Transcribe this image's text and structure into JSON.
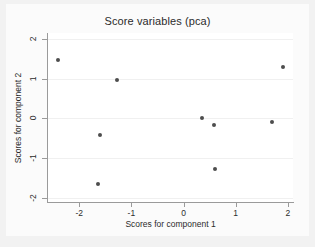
{
  "chart_data": {
    "type": "scatter",
    "title": "Score variables (pca)",
    "xlabel": "Scores for component 1",
    "ylabel": "Scores for component 2",
    "xlim": [
      -2.6,
      2.1
    ],
    "ylim": [
      -2.1,
      2.15
    ],
    "xticks": [
      -2,
      -1,
      0,
      1,
      2
    ],
    "xticklabels": [
      "-2",
      "-1",
      "0",
      "1",
      "2"
    ],
    "yticks": [
      2,
      1,
      0,
      -1,
      -2
    ],
    "yticklabels": [
      "2",
      "1",
      "0",
      "-1",
      "-2"
    ],
    "grid": "horizontal",
    "legend": "none",
    "marker_color": "#4d4d4d",
    "points": [
      {
        "x": -2.4,
        "y": 1.48
      },
      {
        "x": -1.27,
        "y": 0.97
      },
      {
        "x": -1.6,
        "y": -0.41
      },
      {
        "x": -1.64,
        "y": -1.65
      },
      {
        "x": 0.36,
        "y": 0.0
      },
      {
        "x": 0.58,
        "y": -0.17
      },
      {
        "x": 0.6,
        "y": -1.27
      },
      {
        "x": 1.69,
        "y": -0.1
      },
      {
        "x": 1.91,
        "y": 1.29
      }
    ]
  },
  "figure": {
    "background": "#f2f2f2",
    "plot_background": "#ffffff"
  }
}
